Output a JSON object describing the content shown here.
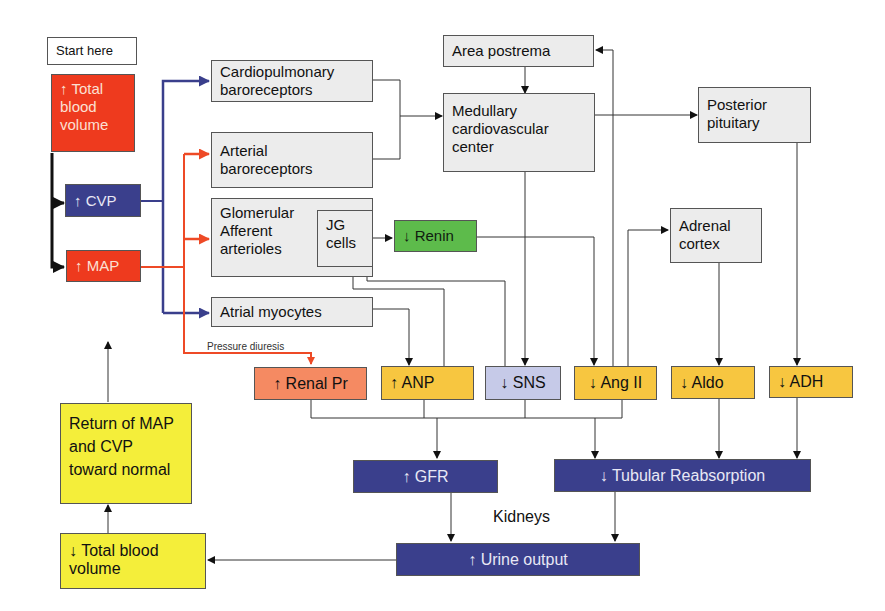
{
  "nodes": {
    "start_here": "Start here",
    "total_blood_volume_up": "↑ Total blood volume",
    "cvp_up": "↑ CVP",
    "map_up": "↑ MAP",
    "cardiopulmonary": "Cardiopulmonary baroreceptors",
    "arterial": "Arterial baroreceptors",
    "glomerular": "Glomerular Afferent arterioles",
    "jg_cells": "JG cells",
    "atrial": "Atrial myocytes",
    "area_postrema": "Area postrema",
    "medullary": "Medullary cardiovascular center",
    "posterior_pituitary": "Posterior pituitary",
    "adrenal_cortex": "Adrenal cortex",
    "renin_down": "↓ Renin",
    "renal_pr_up": "↑ Renal Pr",
    "anp_up": "↑ ANP",
    "sns_down": "↓ SNS",
    "ang2_down": "↓ Ang II",
    "aldo_down": "↓ Aldo",
    "adh_down": "↓ ADH",
    "gfr_up": "↑ GFR",
    "tubular_down": "↓ Tubular Reabsorption",
    "urine_up": "↑ Urine output",
    "total_blood_volume_down": "↓ Total blood volume",
    "return_normal": "Return of MAP and CVP toward normal"
  },
  "labels": {
    "pressure_diuresis": "Pressure diuresis",
    "kidneys": "Kidneys"
  },
  "colors": {
    "red": "#ee3a1e",
    "navy": "#3a3f8c",
    "green": "#5dbb4b",
    "salmon": "#f58a62",
    "gold": "#f7c640",
    "lavender": "#c6cae8",
    "yellow": "#f4ee3a",
    "gray": "#ececec",
    "blue_line": "#3a3f8c",
    "red_line": "#ee4a26"
  }
}
